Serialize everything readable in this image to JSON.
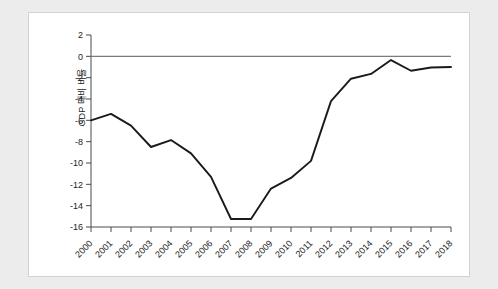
{
  "chart_data": {
    "type": "line",
    "title": "",
    "subtitle": "",
    "xlabel": "",
    "ylabel": "GDP 대비 비율",
    "categories": [
      "2000",
      "2001",
      "2002",
      "2003",
      "2004",
      "2005",
      "2006",
      "2007",
      "2008",
      "2009",
      "2010",
      "2011",
      "2012",
      "2013",
      "2014",
      "2015",
      "2016",
      "2017",
      "2018"
    ],
    "x": [
      2000,
      2001,
      2002,
      2003,
      2004,
      2005,
      2006,
      2007,
      2008,
      2009,
      2010,
      2011,
      2012,
      2013,
      2014,
      2015,
      2016,
      2017,
      2018
    ],
    "values": [
      -6.0,
      -5.4,
      -6.5,
      -8.5,
      -7.85,
      -9.1,
      -11.3,
      -15.25,
      -15.25,
      -12.4,
      -11.4,
      -9.8,
      -4.2,
      -2.1,
      -1.65,
      -0.35,
      -1.35,
      -1.05,
      -1.0
    ],
    "series": [
      {
        "name": "GDP 대비 비율",
        "values": [
          -6.0,
          -5.4,
          -6.5,
          -8.5,
          -7.85,
          -9.1,
          -11.3,
          -15.25,
          -15.25,
          -12.4,
          -11.4,
          -9.8,
          -4.2,
          -2.1,
          -1.65,
          -0.35,
          -1.35,
          -1.05,
          -1.0
        ]
      }
    ],
    "ylim": [
      -16,
      2
    ],
    "xlim": [
      2000,
      2018
    ],
    "yticks": [
      2,
      0,
      -2,
      -4,
      -6,
      -8,
      -10,
      -12,
      -14,
      -16
    ],
    "ytick_labels": [
      "2",
      "0",
      "-2",
      "-4",
      "-6",
      "-8",
      "-10",
      "-12",
      "-14",
      "-16"
    ],
    "grid": false,
    "legend": null,
    "legend_position": "none",
    "annotations": [],
    "zero_reference_line": 0,
    "line_color": "#1a1a1a",
    "zero_line_color": "#7b7b7b",
    "axis_color": "#4a4a4a",
    "panel_background": "#ffffff",
    "page_background": "#ececed"
  }
}
